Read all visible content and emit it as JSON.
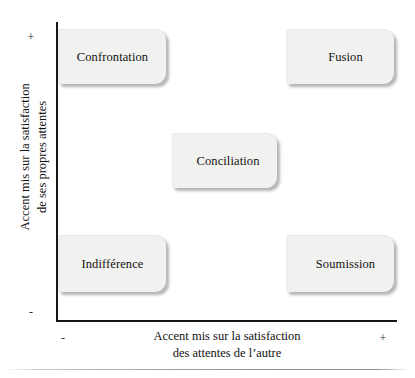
{
  "diagram": {
    "type": "2x2-matrix",
    "title": "",
    "axes": {
      "y": {
        "label_line1": "Accent mis sur la satisfaction",
        "label_line2": "de ses propres attentes",
        "high_marker": "+",
        "low_marker": "-"
      },
      "x": {
        "label_line1": "Accent mis sur la satisfaction",
        "label_line2": "des attentes de l’autre",
        "high_marker": "+",
        "low_marker": "-"
      }
    },
    "nodes": [
      {
        "id": "confrontation",
        "label": "Confrontation",
        "quadrant": "top-left"
      },
      {
        "id": "fusion",
        "label": "Fusion",
        "quadrant": "top-right"
      },
      {
        "id": "conciliation",
        "label": "Conciliation",
        "quadrant": "center"
      },
      {
        "id": "indifference",
        "label": "Indifférence",
        "quadrant": "bottom-left"
      },
      {
        "id": "soumission",
        "label": "Soumission",
        "quadrant": "bottom-right"
      }
    ],
    "colors": {
      "node_fill": "#f1f1ef",
      "node_shadow": "#787878",
      "axis": "#171717",
      "text": "#131313",
      "background": "#ffffff"
    }
  }
}
